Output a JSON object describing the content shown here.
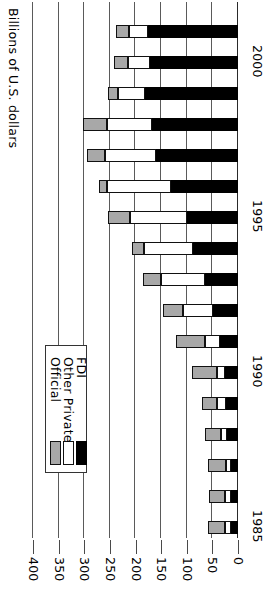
{
  "chart_data": {
    "type": "bar",
    "subtype": "stacked-horizontal",
    "title": "",
    "xlabel": "Billions of U.S. dollars",
    "ylabel": "",
    "orientation": "rotated-90",
    "grid": true,
    "legend_position": "inside-left",
    "axis_title": "Billions of U.S. dollars",
    "value_ticks": [
      "400",
      "350",
      "300",
      "250",
      "200",
      "150",
      "100",
      "50",
      "0"
    ],
    "value_tick_numbers": [
      400,
      350,
      300,
      250,
      200,
      150,
      100,
      50,
      0
    ],
    "vlim": [
      0,
      400
    ],
    "categories": [
      "1985",
      "1986",
      "1987",
      "1988",
      "1989",
      "1990",
      "1991",
      "1992",
      "1993",
      "1994",
      "1995",
      "1996",
      "1997",
      "1998",
      "1999",
      "2000",
      "2001"
    ],
    "category_labels_shown": [
      "1985",
      "1990",
      "1995",
      "2000"
    ],
    "series": [
      {
        "name": "Official",
        "color": "#a8a8a8",
        "values": [
          33,
          31,
          36,
          31,
          29,
          48,
          55,
          38,
          35,
          24,
          43,
          17,
          34,
          46,
          20,
          28,
          26
        ]
      },
      {
        "name": "Other Private",
        "color": "#ffffff",
        "values": [
          12,
          12,
          9,
          13,
          17,
          16,
          30,
          60,
          85,
          95,
          110,
          125,
          100,
          88,
          52,
          42,
          38
        ]
      },
      {
        "name": "FDI",
        "color": "#000000",
        "values": [
          13,
          13,
          14,
          21,
          24,
          25,
          35,
          48,
          65,
          88,
          100,
          130,
          160,
          168,
          182,
          172,
          175
        ]
      }
    ]
  },
  "legend": {
    "items": [
      {
        "label": "Official",
        "swatch": "official"
      },
      {
        "label": "Other Private",
        "swatch": "other"
      },
      {
        "label": "FDI",
        "swatch": "fdi"
      }
    ]
  },
  "colors": {
    "official": "#a8a8a8",
    "other_private": "#ffffff",
    "fdi": "#000000",
    "grid": "#5a5a5a",
    "text": "#000000"
  }
}
